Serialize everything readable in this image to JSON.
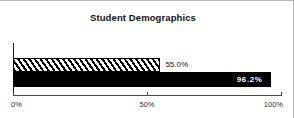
{
  "chart_data": {
    "type": "bar",
    "orientation": "horizontal",
    "title": "Student Demographics",
    "xlabel": "",
    "ylabel": "",
    "xlim": [
      0,
      100
    ],
    "grid": false,
    "legend": null,
    "categories": [
      "",
      ""
    ],
    "values": [
      55.0,
      96.2
    ],
    "data_labels": [
      "55.0%",
      "96.2%"
    ],
    "x_ticks": [
      {
        "value": 0,
        "label": "0%"
      },
      {
        "value": 50,
        "label": "50%"
      },
      {
        "value": 100,
        "label": "100%"
      }
    ],
    "series": [
      {
        "name": "series-1",
        "value": 55.0,
        "label": "55.0%",
        "fill": "hatched-diagonal",
        "fill_color": "#ffffff",
        "line_color": "#000000",
        "label_color": "#111111",
        "label_position": "outside"
      },
      {
        "name": "series-2",
        "value": 96.2,
        "label": "96.2%",
        "fill": "solid",
        "fill_color": "#000000",
        "line_color": "#000000",
        "label_color": "#ffffff",
        "label_position": "inside"
      }
    ],
    "colors": {
      "background": "#ffffff",
      "axis": "#4a4a4a",
      "text": "#111111",
      "border": "#b8b8b8"
    }
  }
}
